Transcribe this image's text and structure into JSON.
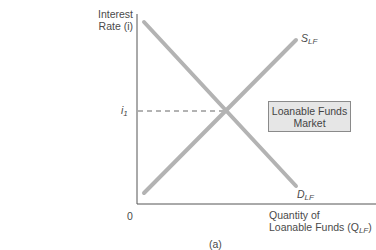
{
  "diagram": {
    "y_axis_label_line1": "Interest",
    "y_axis_label_line2": "Rate (i)",
    "x_axis_label_line1": "Quantity of",
    "x_axis_label_line2": "Loanable Funds (Q",
    "x_axis_label_sub": "LF",
    "x_axis_label_close": ")",
    "origin": "0",
    "equilibrium_rate": "i",
    "equilibrium_rate_sub": "1",
    "supply_label": "S",
    "supply_sub": "LF",
    "demand_label": "D",
    "demand_sub": "LF",
    "market_box_line1": "Loanable Funds",
    "market_box_line2": "Market",
    "caption": "(a)",
    "colors": {
      "curve": "#b3b3b3",
      "axis": "#555555",
      "box_fill": "#e6e6e6"
    }
  }
}
